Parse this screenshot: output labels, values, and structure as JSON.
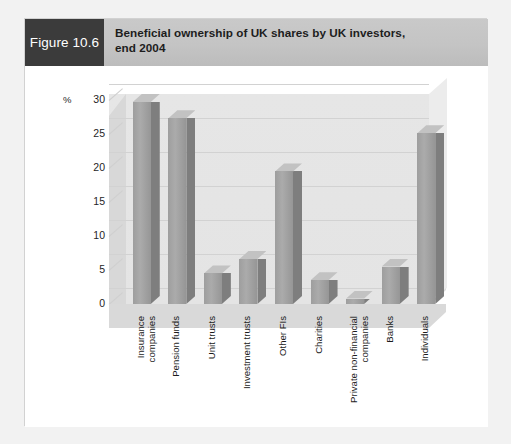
{
  "figure": {
    "tag_label": "Figure 10.6",
    "title_line1": "Beneficial ownership of UK shares by UK investors,",
    "title_line2": "end 2004",
    "tag_background": "#3b3b3b",
    "header_background": "#c4c4c4",
    "card_background": "#ffffff"
  },
  "chart_data": {
    "type": "bar",
    "title": "Beneficial ownership of UK shares by UK investors, end 2004",
    "xlabel": "",
    "ylabel": "%",
    "ylim": [
      0,
      30
    ],
    "yticks": [
      0,
      5,
      10,
      15,
      20,
      25,
      30
    ],
    "ytick_labels": [
      "0",
      "5",
      "10",
      "15",
      "20",
      "25",
      "30"
    ],
    "grid": true,
    "legend": null,
    "three_d": true,
    "bar_color": "#9e9e9e",
    "bar_side_color": "#7e7e7e",
    "bar_top_color": "#c2c2c2",
    "categories": [
      "Insurance companies",
      "Pension funds",
      "Unit trusts",
      "Investment trusts",
      "Other FIs",
      "Charities",
      "Private non-financial companies",
      "Banks",
      "Individuals"
    ],
    "category_lines": [
      [
        "Insurance",
        "companies"
      ],
      [
        "Pension funds"
      ],
      [
        "Unit trusts"
      ],
      [
        "Investment trusts"
      ],
      [
        "Other FIs"
      ],
      [
        "Charities"
      ],
      [
        "Private non-financial",
        "companies"
      ],
      [
        "Banks"
      ],
      [
        "Individuals"
      ]
    ],
    "values": [
      29.7,
      27.3,
      4.5,
      6.6,
      19.5,
      3.5,
      0.8,
      5.5,
      25.1
    ]
  }
}
